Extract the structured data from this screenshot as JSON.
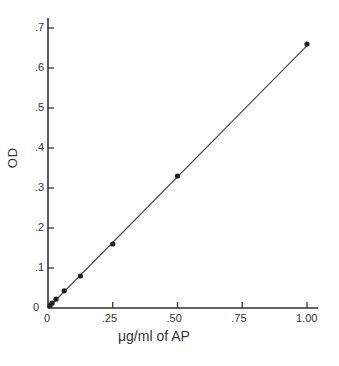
{
  "chart_data": {
    "type": "scatter",
    "title": "",
    "xlabel": "μg/ml of AP",
    "ylabel": "OD",
    "xlim": [
      0,
      1.0
    ],
    "ylim": [
      0,
      0.7
    ],
    "grid": false,
    "legend": null,
    "x_ticks": [
      0,
      0.25,
      0.5,
      0.75,
      1.0
    ],
    "x_tick_labels": [
      "0",
      ".25",
      ".50",
      ".75",
      "1.00"
    ],
    "y_ticks": [
      0,
      0.1,
      0.2,
      0.3,
      0.4,
      0.5,
      0.6,
      0.7
    ],
    "y_tick_labels": [
      "0",
      ".1",
      ".2",
      ".3",
      ".4",
      ".5",
      ".6",
      ".7"
    ],
    "series": [
      {
        "name": "AP standard",
        "x": [
          0.0078,
          0.0156,
          0.031,
          0.0625,
          0.125,
          0.25,
          0.5,
          1.0
        ],
        "y": [
          0.006,
          0.012,
          0.022,
          0.043,
          0.08,
          0.16,
          0.33,
          0.66
        ]
      }
    ],
    "fit_line": {
      "x": [
        0,
        1.0
      ],
      "y": [
        0,
        0.656
      ]
    }
  }
}
